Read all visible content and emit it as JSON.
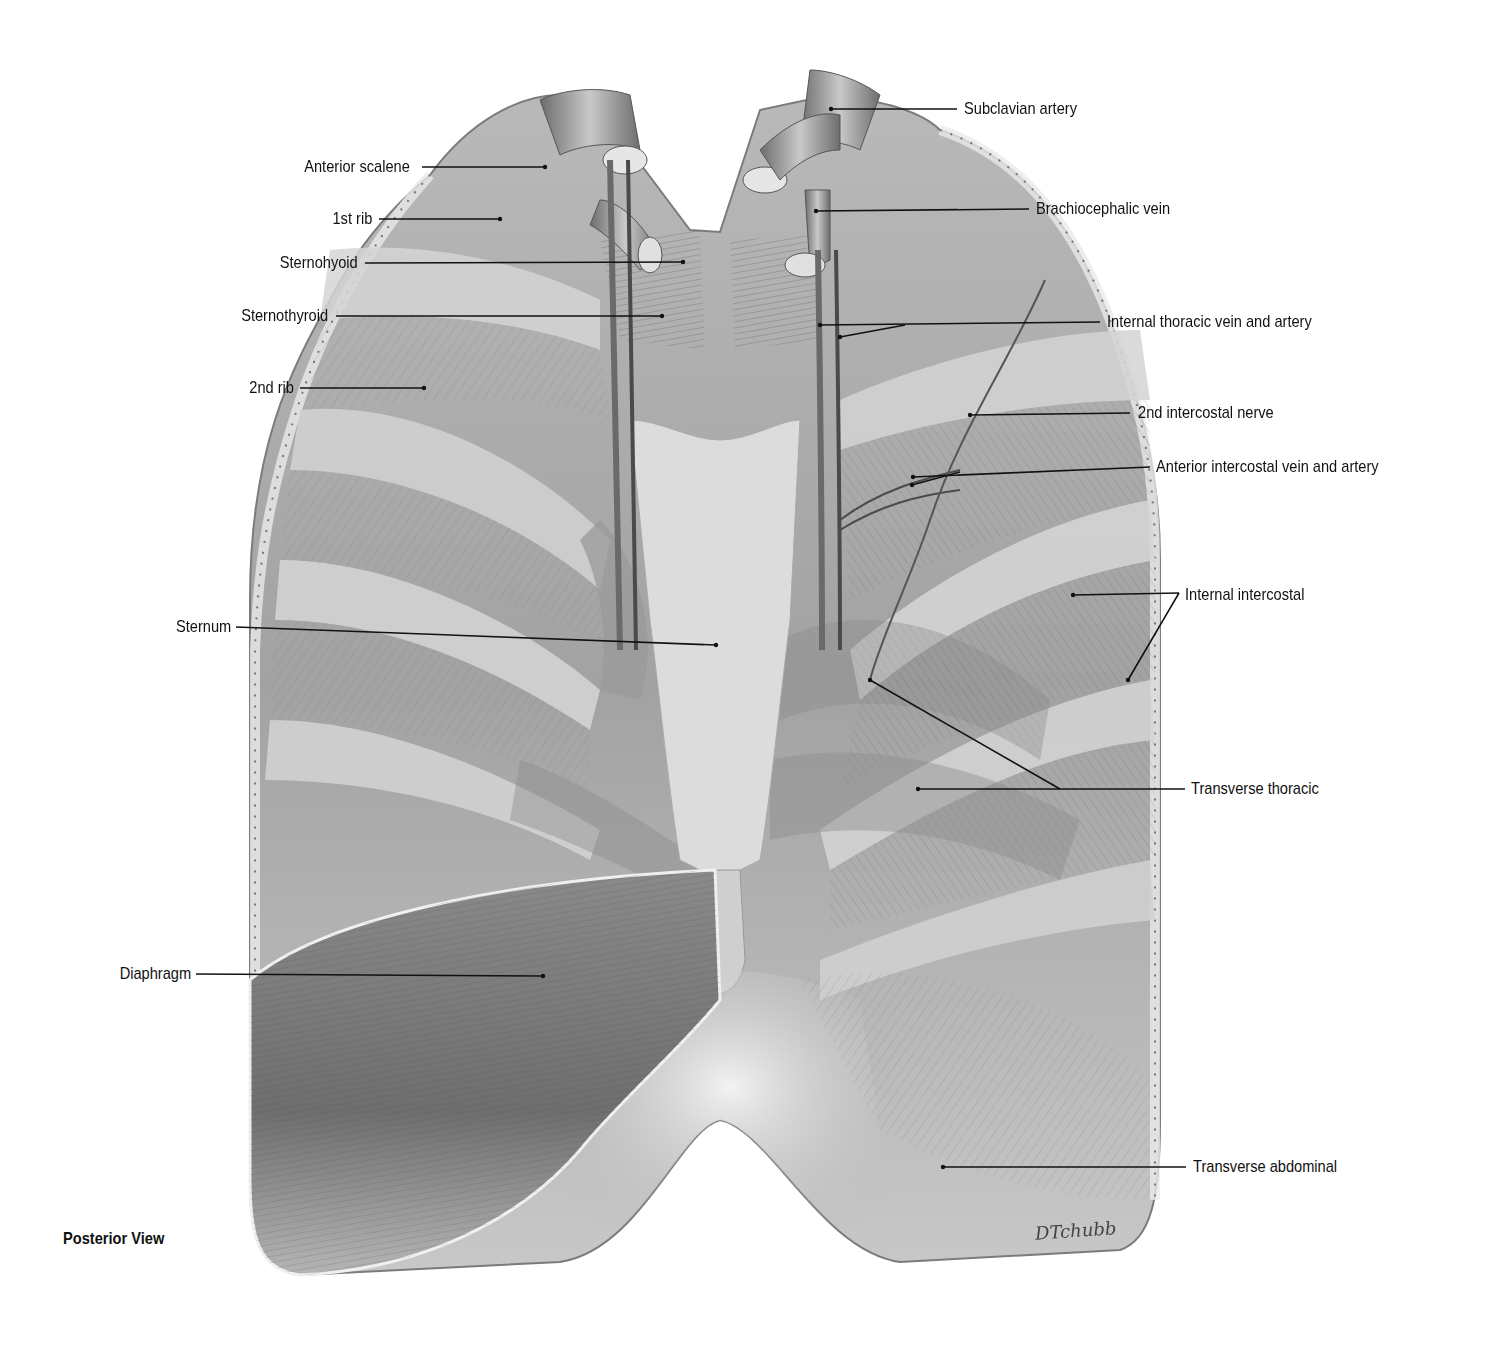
{
  "figure": {
    "view_caption": "Posterior View",
    "signature": "DTchubb",
    "colors": {
      "background": "#ffffff",
      "tissue_light": "#d9d9d9",
      "tissue_mid": "#a8a8a8",
      "tissue_dark": "#5a5a5a",
      "leader_line": "#111111",
      "label_text": "#111111"
    }
  },
  "labels": {
    "left": [
      {
        "text": "Anterior scalene",
        "x": 410,
        "y": 168,
        "tx": 545,
        "ty": 167
      },
      {
        "text": "1st rib",
        "x": 372,
        "y": 219,
        "tx": 500,
        "ty": 219
      },
      {
        "text": "Sternohyoid",
        "x": 358,
        "y": 263,
        "tx": 683,
        "ty": 262
      },
      {
        "text": "Sternothyroid",
        "x": 328,
        "y": 316,
        "tx": 662,
        "ty": 316
      },
      {
        "text": "2nd rib",
        "x": 294,
        "y": 388,
        "tx": 424,
        "ty": 388
      },
      {
        "text": "Sternum",
        "x": 231,
        "y": 627,
        "tx": 716,
        "ty": 645
      },
      {
        "text": "Diaphragm",
        "x": 191,
        "y": 974,
        "tx": 543,
        "ty": 976
      }
    ],
    "right": [
      {
        "text": "Subclavian artery",
        "x": 964,
        "y": 109,
        "tx": 831,
        "ty": 109
      },
      {
        "text": "Brachiocephalic vein",
        "x": 1036,
        "y": 209,
        "tx": 816,
        "ty": 211
      },
      {
        "text": "Internal thoracic vein and artery",
        "x": 1107,
        "y": 322
      },
      {
        "text": "2nd intercostal nerve",
        "x": 1138,
        "y": 413,
        "tx": 970,
        "ty": 415
      },
      {
        "text": "Anterior intercostal vein and artery",
        "x": 1156,
        "y": 467
      },
      {
        "text": "Internal intercostal",
        "x": 1185,
        "y": 595
      },
      {
        "text": "Transverse thoracic",
        "x": 1191,
        "y": 789
      },
      {
        "text": "Transverse abdominal",
        "x": 1193,
        "y": 1167,
        "tx": 943,
        "ty": 1167
      }
    ]
  }
}
